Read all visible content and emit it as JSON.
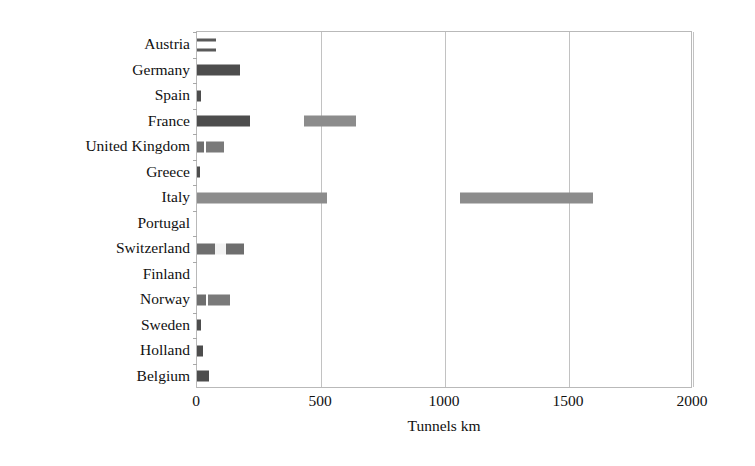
{
  "chart_data": {
    "type": "bar",
    "orientation": "horizontal",
    "title": "",
    "subtitle": "",
    "xlabel": "Tunnels km",
    "ylabel": "",
    "xlim": [
      0,
      2000
    ],
    "xticks": [
      0,
      500,
      1000,
      1500,
      2000
    ],
    "xtick_labels": [
      "0",
      "500",
      "1000",
      "1500",
      "2000"
    ],
    "grid": true,
    "grid_axis": "x",
    "legend": false,
    "legend_position": "none",
    "categories": [
      "Austria",
      "Germany",
      "Spain",
      "France",
      "United Kingdom",
      "Greece",
      "Italy",
      "Portugal",
      "Switzerland",
      "Finland",
      "Norway",
      "Sweden",
      "Holland",
      "Belgium"
    ],
    "series": [
      {
        "name": "segment-1",
        "color": "#4d4d4d",
        "values": [
          75,
          175,
          15,
          215,
          110,
          12,
          525,
          0,
          190,
          0,
          135,
          15,
          25,
          50
        ]
      },
      {
        "name": "segment-2",
        "color": "#8c8c8c",
        "start": [
          0,
          0,
          0,
          430,
          0,
          0,
          1060,
          0,
          0,
          0,
          0,
          0,
          0,
          0
        ],
        "values": [
          0,
          0,
          0,
          640,
          0,
          0,
          1595,
          0,
          0,
          0,
          0,
          0,
          0,
          0
        ]
      }
    ],
    "bars": [
      {
        "category": "Austria",
        "segments": [
          {
            "start": 0,
            "end": 75,
            "style": "hollow"
          }
        ]
      },
      {
        "category": "Germany",
        "segments": [
          {
            "start": 0,
            "end": 175,
            "style": "solid-dark"
          }
        ]
      },
      {
        "category": "Spain",
        "segments": [
          {
            "start": 0,
            "end": 15,
            "style": "solid-dark"
          }
        ]
      },
      {
        "category": "France",
        "segments": [
          {
            "start": 0,
            "end": 215,
            "style": "solid-dark"
          },
          {
            "start": 430,
            "end": 640,
            "style": "solid-gray"
          }
        ]
      },
      {
        "category": "United Kingdom",
        "segments": [
          {
            "start": 0,
            "end": 110,
            "style": "nick"
          }
        ]
      },
      {
        "category": "Greece",
        "segments": [
          {
            "start": 0,
            "end": 12,
            "style": "solid-dark"
          }
        ]
      },
      {
        "category": "Italy",
        "segments": [
          {
            "start": 0,
            "end": 525,
            "style": "solid-gray"
          },
          {
            "start": 1060,
            "end": 1595,
            "style": "solid-gray"
          }
        ]
      },
      {
        "category": "Portugal",
        "segments": []
      },
      {
        "category": "Switzerland",
        "segments": [
          {
            "start": 0,
            "end": 190,
            "style": "split"
          }
        ]
      },
      {
        "category": "Finland",
        "segments": []
      },
      {
        "category": "Norway",
        "segments": [
          {
            "start": 0,
            "end": 135,
            "style": "nick"
          }
        ]
      },
      {
        "category": "Sweden",
        "segments": [
          {
            "start": 0,
            "end": 15,
            "style": "solid-dark"
          }
        ]
      },
      {
        "category": "Holland",
        "segments": [
          {
            "start": 0,
            "end": 25,
            "style": "solid-dark"
          }
        ]
      },
      {
        "category": "Belgium",
        "segments": [
          {
            "start": 0,
            "end": 50,
            "style": "solid-dark"
          }
        ]
      }
    ],
    "colors": {
      "series_dark": "#4d4d4d",
      "series_gray": "#8c8c8c",
      "gridline": "#c2c2c2",
      "frame": "#b9b9b9",
      "text": "#111111",
      "background": "#ffffff"
    }
  }
}
